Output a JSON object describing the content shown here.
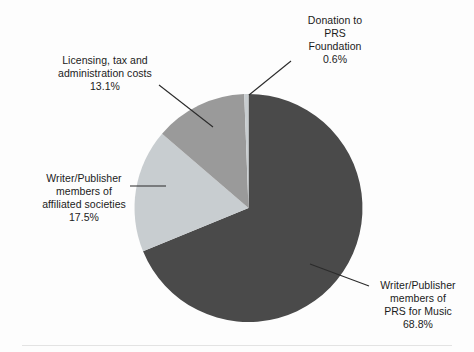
{
  "chart_data": {
    "type": "pie",
    "title": "",
    "subtitle": "",
    "xlabel": "",
    "ylabel": "",
    "legend_position": "none",
    "grid": false,
    "total_percent": 100.0,
    "categories": [
      "Writer/Publisher members of PRS for Music",
      "Donation to PRS Foundation",
      "Licensing, tax and administration costs",
      "Writer/Publisher members of affiliated societies"
    ],
    "values": [
      68.8,
      0.6,
      13.1,
      17.5
    ],
    "slices": [
      {
        "id": "prs-for-music",
        "name": "Writer/Publisher members of PRS for Music",
        "label_lines": "Writer/Publisher\nmembers of\nPRS for Music",
        "value": 68.8,
        "value_label": "68.8%",
        "color": "#4a4a4a",
        "start_angle_deg": 0.0,
        "end_angle_deg": 247.68
      },
      {
        "id": "affiliated-societies",
        "name": "Writer/Publisher members of affiliated societies",
        "label_lines": "Writer/Publisher\nmembers of\naffiliated societies",
        "value": 17.5,
        "value_label": "17.5%",
        "color": "#c8cdd0",
        "start_angle_deg": 247.68,
        "end_angle_deg": 310.68
      },
      {
        "id": "licensing-admin",
        "name": "Licensing, tax and administration costs",
        "label_lines": "Licensing, tax and\nadministration costs",
        "value": 13.1,
        "value_label": "13.1%",
        "color": "#9a9a9a",
        "start_angle_deg": 310.68,
        "end_angle_deg": 357.84
      },
      {
        "id": "prs-foundation-donation",
        "name": "Donation to PRS Foundation",
        "label_lines": "Donation to\nPRS\nFoundation",
        "value": 0.6,
        "value_label": "0.6%",
        "color": "#c8cdd0",
        "start_angle_deg": 357.84,
        "end_angle_deg": 360.0
      }
    ]
  },
  "labels": {
    "donation": {
      "text": "Donation to\nPRS\nFoundation\n0.6%"
    },
    "licensing": {
      "text": "Licensing, tax and\nadministration costs\n13.1%"
    },
    "affiliated": {
      "text": "Writer/Publisher\nmembers of\naffiliated societies\n17.5%"
    },
    "prs_for_music": {
      "text": "Writer/Publisher\nmembers of\nPRS for Music\n68.8%"
    }
  },
  "colors": {
    "background": "#fdfdfd",
    "dark_gray": "#4a4a4a",
    "medium_gray": "#9a9a9a",
    "light_gray": "#c8cdd0",
    "leader_line": "#2b2b2b",
    "footer_rule": "#e3e3e3",
    "text": "#1b1b1b"
  },
  "geometry": {
    "center_x": 248.5,
    "center_y": 208.0,
    "radius": 114.0
  }
}
